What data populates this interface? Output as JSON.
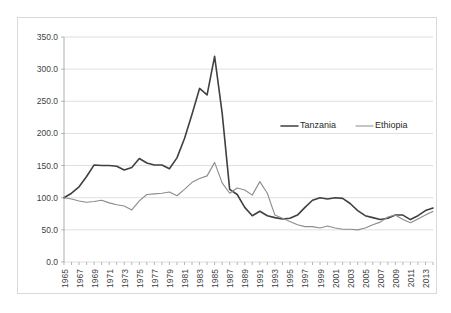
{
  "chart_data": {
    "type": "line",
    "title": "",
    "xlabel": "",
    "ylabel": "",
    "ylim": [
      0,
      350
    ],
    "ytick_step": 50,
    "ytick_labels": [
      "0.0",
      "50.0",
      "100.0",
      "150.0",
      "200.0",
      "250.0",
      "300.0",
      "350.0"
    ],
    "ytick_values": [
      0,
      50,
      100,
      150,
      200,
      250,
      300,
      350
    ],
    "grid": true,
    "legend_position": "inside-upper-right",
    "x": [
      1965,
      1966,
      1967,
      1968,
      1969,
      1970,
      1971,
      1972,
      1973,
      1974,
      1975,
      1976,
      1977,
      1978,
      1979,
      1980,
      1981,
      1982,
      1983,
      1984,
      1985,
      1986,
      1987,
      1988,
      1989,
      1990,
      1991,
      1992,
      1993,
      1994,
      1995,
      1996,
      1997,
      1998,
      1999,
      2000,
      2001,
      2002,
      2003,
      2004,
      2005,
      2006,
      2007,
      2008,
      2009,
      2010,
      2011,
      2012,
      2013,
      2014
    ],
    "xtick_labels": [
      "1965",
      "1967",
      "1969",
      "1971",
      "1973",
      "1975",
      "1977",
      "1979",
      "1981",
      "1983",
      "1985",
      "1987",
      "1989",
      "1991",
      "1993",
      "1995",
      "1997",
      "1999",
      "2001",
      "2003",
      "2005",
      "2007",
      "2009",
      "2011",
      "2013"
    ],
    "xtick_values": [
      1965,
      1967,
      1969,
      1971,
      1973,
      1975,
      1977,
      1979,
      1981,
      1983,
      1985,
      1987,
      1989,
      1991,
      1993,
      1995,
      1997,
      1999,
      2001,
      2003,
      2005,
      2007,
      2009,
      2011,
      2013
    ],
    "series": [
      {
        "name": "Tanzania",
        "color": "#404040",
        "width": 1.6,
        "values": [
          100,
          107,
          117,
          133,
          151,
          150,
          150,
          149,
          143,
          147,
          161,
          154,
          151,
          151,
          145,
          162,
          192,
          230,
          270,
          260,
          320,
          232,
          113,
          105,
          85,
          72,
          79,
          72,
          69,
          67,
          68,
          73,
          85,
          96,
          100,
          98,
          100,
          99,
          91,
          80,
          72,
          69,
          66,
          68,
          73,
          73,
          66,
          72,
          80,
          84
        ]
      },
      {
        "name": "Ethiopia",
        "color": "#8c8c8c",
        "width": 1.1,
        "values": [
          100,
          98,
          95,
          93,
          94,
          96,
          92,
          89,
          87,
          81,
          95,
          105,
          106,
          107,
          109,
          103,
          113,
          124,
          130,
          134,
          155,
          123,
          107,
          115,
          112,
          104,
          125,
          107,
          73,
          68,
          63,
          58,
          55,
          55,
          53,
          56,
          53,
          51,
          51,
          50,
          53,
          58,
          62,
          70,
          73,
          66,
          61,
          67,
          73,
          79
        ]
      }
    ]
  },
  "legend": {
    "items": [
      {
        "label": "Tanzania"
      },
      {
        "label": "Ethiopia"
      }
    ]
  }
}
